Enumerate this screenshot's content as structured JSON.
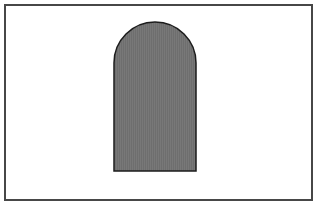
{
  "diagram": {
    "frame": {
      "x": 5,
      "y": 5,
      "width": 307,
      "height": 195,
      "stroke": "#474747",
      "stroke_width": 2,
      "fill": "#ffffff"
    },
    "shape": {
      "kind": "arch",
      "description": "Rectangle with semicircular top (tombstone / arched door shape)",
      "left": 114,
      "right": 196,
      "top": 22,
      "bottom": 171,
      "arc_radius": 41,
      "fill": "#6e6e6e",
      "stripe_color": "#787878",
      "stroke": "#1c1c1c",
      "stroke_width": 1.5
    }
  }
}
